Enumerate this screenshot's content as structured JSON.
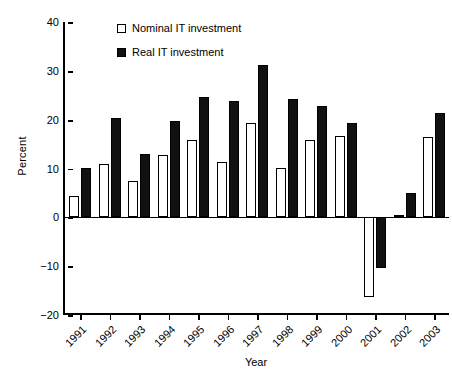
{
  "chart_data": {
    "type": "bar",
    "title": "",
    "xlabel": "Year",
    "ylabel": "Percent",
    "ylim": [
      -20,
      40
    ],
    "yticks": [
      40,
      30,
      20,
      10,
      0,
      -10,
      -20
    ],
    "ytick_labels": [
      "40",
      "30",
      "20",
      "10",
      "0",
      "−10",
      "−20"
    ],
    "grid": false,
    "legend_position": "upper-left-inside",
    "categories": [
      "1991",
      "1992",
      "1993",
      "1994",
      "1995",
      "1996",
      "1997",
      "1998",
      "1999",
      "2000",
      "2001",
      "2002",
      "2003"
    ],
    "series": [
      {
        "name": "Nominal IT investment",
        "color": "#ffffff",
        "edge_color": "#000000",
        "values": [
          4.4,
          11.0,
          7.4,
          12.8,
          15.9,
          11.4,
          19.4,
          10.2,
          15.8,
          16.7,
          -16.4,
          0.4,
          16.4
        ]
      },
      {
        "name": "Real IT investment",
        "color": "#111111",
        "edge_color": "#000000",
        "values": [
          10.2,
          20.4,
          13.0,
          19.7,
          24.7,
          23.8,
          31.2,
          24.3,
          22.7,
          19.4,
          -10.3,
          5.0,
          21.3
        ]
      }
    ]
  },
  "legend": {
    "items": [
      {
        "label": "Nominal IT investment",
        "marker": "hollow-square-icon"
      },
      {
        "label": "Real IT investment",
        "marker": "filled-square-icon"
      }
    ]
  }
}
